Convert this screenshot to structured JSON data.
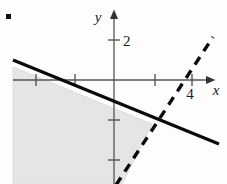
{
  "figure": {
    "problem_marker": ".",
    "axes": {
      "x_label": "x",
      "y_label": "y",
      "origin_px": [
        114,
        80
      ],
      "unit_px_x": 38.5,
      "unit_px_y": 40,
      "x_ticks_labeled": [
        {
          "value": "4",
          "label": "4"
        }
      ],
      "y_ticks_labeled": [
        {
          "value": "2",
          "label": "2"
        }
      ],
      "x_tick_positions_px": [
        36,
        75,
        155,
        192
      ],
      "y_tick_positions_px": [
        40,
        120,
        160
      ],
      "x_axis_y_px": 80,
      "y_axis_x_px": 114,
      "x_axis_start_px": 13,
      "x_axis_end_px": 214,
      "y_axis_top_px": 12,
      "y_axis_bottom_px": 184
    },
    "colors": {
      "line_solid": "#000000",
      "line_dashed": "#000000",
      "axis": "#555555",
      "shade_fill": "#e4e4e2",
      "shade_stroke": "#d8d8d6",
      "text": "#1a1a1a",
      "background": "#fdfdfd"
    },
    "lines": [
      {
        "name": "solid-boundary-line",
        "style": "solid",
        "stroke_width": 3.2,
        "from_px": [
          13,
          60
        ],
        "to_px": [
          219,
          144
        ]
      },
      {
        "name": "dashed-boundary-line",
        "style": "dashed",
        "stroke_width": 3.4,
        "dash_pattern": "9 7",
        "from_px": [
          116,
          184
        ],
        "to_px": [
          213,
          37
        ]
      }
    ],
    "shaded_region": {
      "name": "solution-region",
      "description": "Region below the solid line and left of the dashed line",
      "polygon_px": "13,67 152,124 122,184 13,184"
    }
  }
}
